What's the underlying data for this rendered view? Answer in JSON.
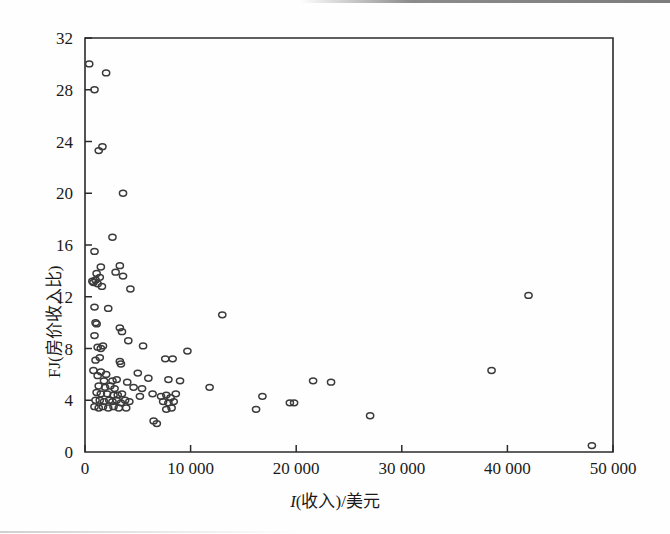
{
  "chart_data": {
    "type": "scatter",
    "title": "",
    "xlabel": "I(收入)/美元",
    "ylabel": "FJ(房价收入比)",
    "xlabel_italic_prefix": "I",
    "xlabel_rest": "(收入)/美元",
    "xlim": [
      0,
      50000
    ],
    "ylim": [
      0,
      32
    ],
    "xticks": [
      0,
      10000,
      20000,
      30000,
      40000,
      50000
    ],
    "xtick_labels": [
      "0",
      "10 000",
      "20 000",
      "30 000",
      "40 000",
      "50 000"
    ],
    "yticks": [
      0,
      4,
      8,
      12,
      16,
      20,
      24,
      28,
      32
    ],
    "ytick_labels": [
      "0",
      "4",
      "8",
      "12",
      "16",
      "20",
      "24",
      "28",
      "32"
    ],
    "grid": false,
    "legend": null,
    "marker": "open-circle",
    "marker_color": "#3a3a3a",
    "points": [
      [
        400,
        30.0
      ],
      [
        2000,
        29.3
      ],
      [
        900,
        28.0
      ],
      [
        1300,
        23.3
      ],
      [
        1650,
        23.6
      ],
      [
        3600,
        20.0
      ],
      [
        2600,
        16.6
      ],
      [
        900,
        15.5
      ],
      [
        1500,
        14.3
      ],
      [
        3300,
        14.4
      ],
      [
        1100,
        13.8
      ],
      [
        2900,
        13.9
      ],
      [
        3600,
        13.6
      ],
      [
        700,
        13.2
      ],
      [
        800,
        13.1
      ],
      [
        1000,
        13.3
      ],
      [
        1200,
        13.0
      ],
      [
        1400,
        13.5
      ],
      [
        1600,
        12.8
      ],
      [
        4300,
        12.6
      ],
      [
        42000,
        12.1
      ],
      [
        900,
        11.2
      ],
      [
        2200,
        11.1
      ],
      [
        1000,
        10.0
      ],
      [
        1100,
        9.9
      ],
      [
        13000,
        10.6
      ],
      [
        3300,
        9.6
      ],
      [
        3500,
        9.3
      ],
      [
        900,
        9.0
      ],
      [
        4100,
        8.6
      ],
      [
        1200,
        8.1
      ],
      [
        1500,
        8.0
      ],
      [
        1700,
        8.2
      ],
      [
        5500,
        8.2
      ],
      [
        9700,
        7.8
      ],
      [
        1400,
        7.3
      ],
      [
        1000,
        7.1
      ],
      [
        3300,
        7.0
      ],
      [
        3400,
        6.8
      ],
      [
        7600,
        7.2
      ],
      [
        8300,
        7.2
      ],
      [
        38500,
        6.3
      ],
      [
        800,
        6.3
      ],
      [
        1500,
        6.2
      ],
      [
        2000,
        6.0
      ],
      [
        1200,
        5.9
      ],
      [
        5000,
        6.1
      ],
      [
        1800,
        5.5
      ],
      [
        2600,
        5.5
      ],
      [
        3000,
        5.6
      ],
      [
        4000,
        5.4
      ],
      [
        6000,
        5.7
      ],
      [
        7900,
        5.6
      ],
      [
        9000,
        5.5
      ],
      [
        21600,
        5.5
      ],
      [
        23300,
        5.4
      ],
      [
        1300,
        5.1
      ],
      [
        1900,
        5.0
      ],
      [
        2400,
        5.1
      ],
      [
        2800,
        4.9
      ],
      [
        4600,
        5.0
      ],
      [
        5400,
        4.9
      ],
      [
        11800,
        5.0
      ],
      [
        1100,
        4.6
      ],
      [
        1500,
        4.5
      ],
      [
        2100,
        4.5
      ],
      [
        2700,
        4.4
      ],
      [
        3100,
        4.4
      ],
      [
        3500,
        4.5
      ],
      [
        5200,
        4.3
      ],
      [
        6400,
        4.5
      ],
      [
        7200,
        4.3
      ],
      [
        7700,
        4.4
      ],
      [
        8100,
        4.2
      ],
      [
        8600,
        4.5
      ],
      [
        16800,
        4.3
      ],
      [
        1000,
        4.0
      ],
      [
        1400,
        4.0
      ],
      [
        1800,
        3.9
      ],
      [
        2300,
        4.0
      ],
      [
        2600,
        3.9
      ],
      [
        3000,
        4.0
      ],
      [
        3400,
        3.8
      ],
      [
        3800,
        4.0
      ],
      [
        4200,
        3.9
      ],
      [
        7400,
        3.9
      ],
      [
        7900,
        3.8
      ],
      [
        8400,
        3.9
      ],
      [
        19400,
        3.8
      ],
      [
        19800,
        3.8
      ],
      [
        900,
        3.5
      ],
      [
        1300,
        3.4
      ],
      [
        1700,
        3.5
      ],
      [
        2200,
        3.4
      ],
      [
        2700,
        3.5
      ],
      [
        3200,
        3.4
      ],
      [
        3900,
        3.4
      ],
      [
        7700,
        3.3
      ],
      [
        8200,
        3.4
      ],
      [
        16200,
        3.3
      ],
      [
        6500,
        2.4
      ],
      [
        6800,
        2.2
      ],
      [
        27000,
        2.8
      ],
      [
        48000,
        0.5
      ]
    ]
  },
  "axis": {
    "x_tick_font_size": 17,
    "y_tick_font_size": 17
  }
}
